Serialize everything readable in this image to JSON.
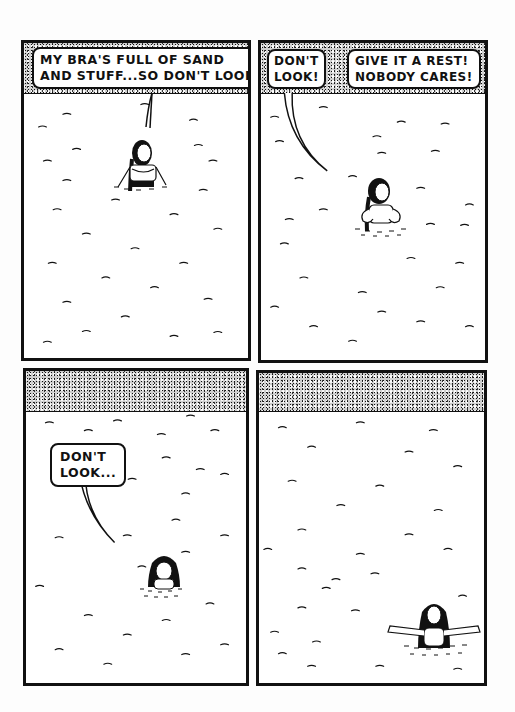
{
  "page": {
    "type": "comic-page",
    "background": "#fdfdfd",
    "ink": "#111111"
  },
  "panels": [
    {
      "id": 1,
      "scene": "beach shoreline with sand strip at top, woman waist-deep in water",
      "bubbles": [
        {
          "text": "MY BRA'S FULL OF SAND\nAND STUFF...SO DON'T LOOK!"
        }
      ]
    },
    {
      "id": 2,
      "scene": "woman adjusting top in water, two speakers",
      "bubbles": [
        {
          "text": "DON'T\nLOOK!"
        },
        {
          "text": "GIVE IT A REST!\nNOBODY CARES!"
        }
      ]
    },
    {
      "id": 3,
      "scene": "wide shot, larger sand strip, woman shoulder-deep in water",
      "bubbles": [
        {
          "text": "DON'T\nLOOK..."
        }
      ]
    },
    {
      "id": 4,
      "scene": "wide shot, woman in water with arms outstretched",
      "bubbles": []
    }
  ]
}
